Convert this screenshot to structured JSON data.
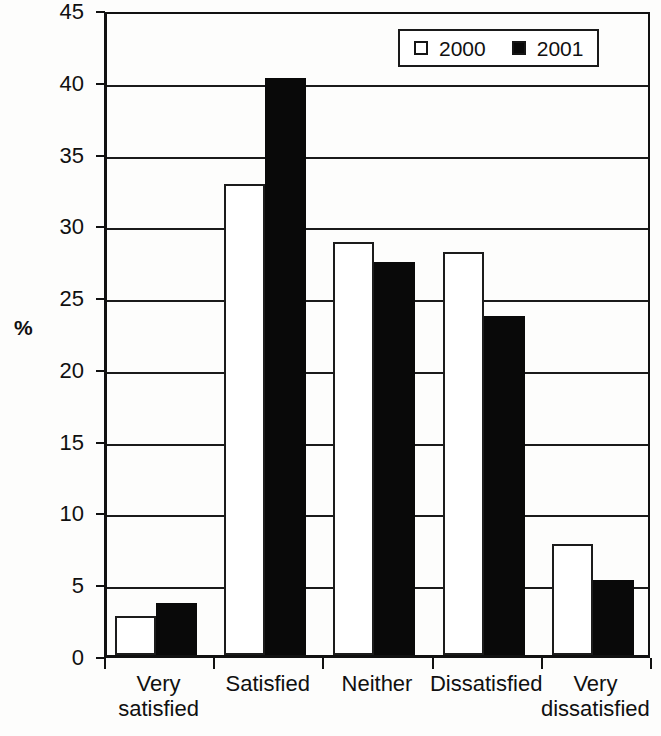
{
  "chart_data": {
    "type": "bar",
    "title": "",
    "subtitle": "",
    "xlabel": "",
    "ylabel": "%",
    "ylim": [
      0,
      45
    ],
    "yticks": [
      0,
      5,
      10,
      15,
      20,
      25,
      30,
      35,
      40,
      45
    ],
    "grid": true,
    "legend_position": "top-right",
    "categories": [
      "Very satisfied",
      "Satisfied",
      "Neither",
      "Dissatisfied",
      "Very dissatisfied"
    ],
    "category_lines": [
      [
        "Very",
        "satisfied"
      ],
      [
        "Satisfied",
        ""
      ],
      [
        "Neither",
        ""
      ],
      [
        "Dissatisfied",
        ""
      ],
      [
        "Very",
        "dissatisfied"
      ]
    ],
    "series": [
      {
        "name": "2000",
        "color": "#ffffff",
        "edge_color": "#1c1c1c",
        "values": [
          2.7,
          32.8,
          28.8,
          28.1,
          7.7
        ]
      },
      {
        "name": "2001",
        "color": "#090909",
        "edge_color": "#090909",
        "values": [
          3.6,
          40.2,
          27.4,
          23.6,
          5.2
        ]
      }
    ],
    "annotations": []
  },
  "legend": {
    "items": [
      {
        "label": "2000",
        "swatch": "open-square-swatch"
      },
      {
        "label": "2001",
        "swatch": "filled-square-swatch"
      }
    ]
  },
  "axes": {
    "y_title": "%",
    "y_tick_labels": [
      "45",
      "40",
      "35",
      "30",
      "25",
      "20",
      "15",
      "10",
      "5",
      "0"
    ],
    "x_tick_labels": [
      {
        "line1": "Very",
        "line2": "satisfied"
      },
      {
        "line1": "Satisfied",
        "line2": ""
      },
      {
        "line1": "Neither",
        "line2": ""
      },
      {
        "line1": "Dissatisfied",
        "line2": ""
      },
      {
        "line1": "Very",
        "line2": "dissatisfied"
      }
    ]
  }
}
